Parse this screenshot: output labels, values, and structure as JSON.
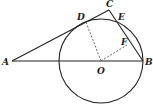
{
  "figure": {
    "points": {
      "A": {
        "label": "A",
        "x": 12,
        "y": 61
      },
      "B": {
        "label": "B",
        "x": 143,
        "y": 61
      },
      "O": {
        "label": "O",
        "x": 101,
        "y": 61
      },
      "C": {
        "label": "C",
        "x": 109,
        "y": 10
      },
      "D": {
        "label": "D",
        "x": 86,
        "y": 22
      },
      "E": {
        "label": "E",
        "x": 116,
        "y": 19
      },
      "F": {
        "label": "F",
        "x": 127,
        "y": 45
      }
    },
    "circle": {
      "center": "O",
      "radius": 42
    },
    "segments_solid": [
      "AB",
      "AC",
      "CB"
    ],
    "segments_dashed": [
      "OD",
      "OF"
    ]
  }
}
